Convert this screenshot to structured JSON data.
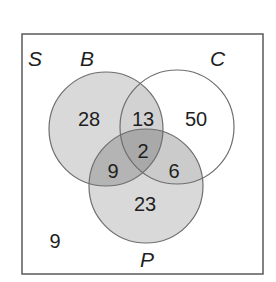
{
  "diagram": {
    "type": "venn-3",
    "universe_label": "S",
    "sets": [
      {
        "label": "B",
        "fill": "#d6d6d6"
      },
      {
        "label": "C",
        "fill": "none"
      },
      {
        "label": "P",
        "fill": "#d6d6d6"
      }
    ],
    "regions": {
      "B_only": "28",
      "B_and_C_only": "13",
      "C_only": "50",
      "B_C_P": "2",
      "B_and_P_only": "9",
      "C_and_P_only": "6",
      "P_only": "23",
      "outside": "9"
    },
    "colors": {
      "outline": "#6e6e6e",
      "light_shade": "#d9d9d9",
      "medium_shade": "#c2c2c2",
      "dark_shade": "#a8a8a8",
      "text": "#1e1e1e"
    }
  }
}
